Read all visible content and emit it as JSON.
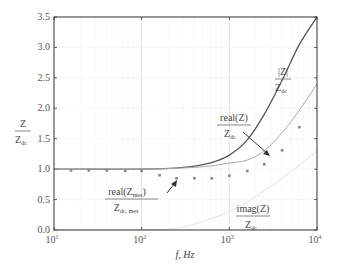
{
  "chart_data": {
    "type": "line",
    "title": "",
    "xlabel": "f, Hz",
    "ylabel": "Z / Z_dc",
    "xscale": "log",
    "xlim": [
      10,
      10000
    ],
    "ylim": [
      0.0,
      3.5
    ],
    "grid": true,
    "x_ticks": [
      "10^1",
      "10^2",
      "10^3",
      "10^4"
    ],
    "y_ticks": [
      "0.0",
      "0.5",
      "1.0",
      "1.5",
      "2.0",
      "2.5",
      "3.0",
      "3.5"
    ],
    "series": [
      {
        "name": "|Z| / Z_dc",
        "style": "dark-line",
        "color": "#555555",
        "x": [
          10,
          100,
          300,
          600,
          1000,
          1600,
          2500,
          4000,
          6300,
          10000
        ],
        "values": [
          1.0,
          1.0,
          1.03,
          1.1,
          1.23,
          1.48,
          1.9,
          2.46,
          3.05,
          3.5
        ]
      },
      {
        "name": "real(Z) / Z_dc",
        "style": "light-line",
        "color": "#aaaaaa",
        "x": [
          10,
          100,
          300,
          600,
          1000,
          1600,
          2500,
          4000,
          6300,
          10000
        ],
        "values": [
          1.0,
          1.0,
          1.02,
          1.05,
          1.1,
          1.15,
          1.3,
          1.6,
          1.97,
          2.4
        ]
      },
      {
        "name": "imag(Z) / Z_dc",
        "style": "faint-line",
        "color": "#dddddd",
        "x": [
          10,
          100,
          300,
          1000,
          2000,
          4000,
          10000
        ],
        "values": [
          0.0,
          0.0,
          0.05,
          0.3,
          0.55,
          0.85,
          1.3
        ]
      },
      {
        "name": "real(Z_mes) / Z_dc,mes",
        "style": "markers",
        "color": "#888888",
        "x": [
          15.6,
          25,
          40,
          65,
          100,
          160,
          250,
          400,
          630,
          1000,
          1600,
          2500,
          4000,
          6300
        ],
        "values": [
          0.98,
          0.98,
          0.98,
          0.97,
          0.97,
          0.9,
          0.85,
          0.85,
          0.85,
          0.89,
          0.97,
          1.08,
          1.31,
          1.69
        ]
      }
    ],
    "annotations": [
      {
        "num": "|Z|",
        "den": "Z_dc"
      },
      {
        "num": "real(Z)",
        "den": "Z_dc"
      },
      {
        "num": "real(Z_mes)",
        "den": "Z_dc,mes"
      },
      {
        "num": "imag(Z)",
        "den": "Z_dc"
      }
    ]
  },
  "labels": {
    "y_num": "Z",
    "y_den": "Z",
    "y_den_sub": "dc",
    "x_axis": "f, Hz",
    "abs_num": "|Z|",
    "abs_den": "Z",
    "abs_den_sub": "dc",
    "real_num": "real(Z)",
    "real_den": "Z",
    "real_den_sub": "dc",
    "mes_num": "real(Z",
    "mes_num_sub": "mes",
    "mes_num_close": ")",
    "mes_den": "Z",
    "mes_den_sub": "dc, mes",
    "imag_num": "imag(Z)",
    "imag_den": "Z",
    "imag_den_sub": "dc"
  }
}
